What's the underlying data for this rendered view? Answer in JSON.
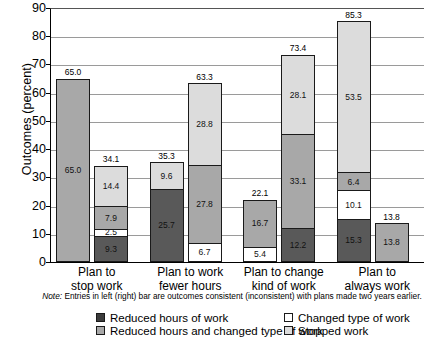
{
  "chart_data": {
    "type": "bar",
    "subtype": "stacked-grouped",
    "title": "",
    "xlabel": "",
    "ylabel": "Outcomes (percent)",
    "ylim": [
      0,
      90
    ],
    "ytick_step": 10,
    "yticks": [
      "90",
      "80",
      "70",
      "60",
      "50",
      "40",
      "30",
      "20",
      "10",
      "0"
    ],
    "grid": true,
    "legend_position": "bottom",
    "note": "Note: Entries in left (right) bar are outcomes consistent (inconsistent) with plans made two years earlier.",
    "note_italic_word": "Note:",
    "legend": [
      {
        "label": "Reduced hours of work",
        "key": "reduced_hours",
        "swatch": "dark"
      },
      {
        "label": "Changed type of work",
        "key": "changed_type",
        "swatch": "white"
      },
      {
        "label": "Reduced hours and changed type of work",
        "key": "reduced_and_changed",
        "swatch": "med"
      },
      {
        "label": "Stopped work",
        "key": "stopped_work",
        "swatch": "light"
      }
    ],
    "series": [
      {
        "name": "Reduced hours of work",
        "key": "reduced_hours",
        "color": "#595959"
      },
      {
        "name": "Changed type of work",
        "key": "changed_type",
        "color": "#ffffff"
      },
      {
        "name": "Reduced hours and changed type of work",
        "key": "reduced_and_changed",
        "color": "#a8a8a8"
      },
      {
        "name": "Stopped work",
        "key": "stopped_work",
        "color": "#dcdcdc"
      }
    ],
    "categories": [
      "Plan to stop work",
      "Plan to work fewer hours",
      "Plan to change kind of work",
      "Plan to always work"
    ],
    "groups": [
      {
        "category_line1": "Plan to",
        "category_line2": "stop work",
        "bars": [
          {
            "side": "left",
            "meaning": "consistent",
            "total": "65.0",
            "total_value": 65.0,
            "segments": [
              {
                "key": "stopped_work",
                "swatch": "med",
                "value": 65.0,
                "label": "65.0"
              }
            ]
          },
          {
            "side": "right",
            "meaning": "inconsistent",
            "total": "34.1",
            "total_value": 34.1,
            "segments": [
              {
                "key": "stopped_work",
                "swatch": "light",
                "value": 14.4,
                "label": "14.4"
              },
              {
                "key": "reduced_and_changed",
                "swatch": "med",
                "value": 7.9,
                "label": "7.9"
              },
              {
                "key": "changed_type",
                "swatch": "white",
                "value": 2.5,
                "label": "2.5"
              },
              {
                "key": "reduced_hours",
                "swatch": "dark",
                "value": 9.3,
                "label": "9.3"
              }
            ]
          }
        ]
      },
      {
        "category_line1": "Plan to work",
        "category_line2": "fewer hours",
        "bars": [
          {
            "side": "left",
            "meaning": "consistent",
            "total": "35.3",
            "total_value": 35.3,
            "segments": [
              {
                "key": "stopped_work",
                "swatch": "light",
                "value": 9.6,
                "label": "9.6"
              },
              {
                "key": "reduced_hours",
                "swatch": "dark",
                "value": 25.7,
                "label": "25.7"
              }
            ]
          },
          {
            "side": "right",
            "meaning": "inconsistent",
            "total": "63.3",
            "total_value": 63.3,
            "segments": [
              {
                "key": "stopped_work",
                "swatch": "light",
                "value": 28.8,
                "label": "28.8"
              },
              {
                "key": "reduced_and_changed",
                "swatch": "med",
                "value": 27.8,
                "label": "27.8"
              },
              {
                "key": "changed_type",
                "swatch": "white",
                "value": 6.7,
                "label": "6.7"
              }
            ]
          }
        ]
      },
      {
        "category_line1": "Plan to change",
        "category_line2": "kind of work",
        "bars": [
          {
            "side": "left",
            "meaning": "consistent",
            "total": "22.1",
            "total_value": 22.1,
            "segments": [
              {
                "key": "reduced_and_changed",
                "swatch": "med",
                "value": 16.7,
                "label": "16.7"
              },
              {
                "key": "changed_type",
                "swatch": "white",
                "value": 5.4,
                "label": "5.4"
              }
            ]
          },
          {
            "side": "right",
            "meaning": "inconsistent",
            "total": "73.4",
            "total_value": 73.4,
            "segments": [
              {
                "key": "stopped_work",
                "swatch": "light",
                "value": 28.1,
                "label": "28.1"
              },
              {
                "key": "reduced_and_changed",
                "swatch": "med",
                "value": 33.1,
                "label": "33.1"
              },
              {
                "key": "reduced_hours",
                "swatch": "dark",
                "value": 12.2,
                "label": "12.2"
              }
            ]
          }
        ]
      },
      {
        "category_line1": "Plan to",
        "category_line2": "always work",
        "bars": [
          {
            "side": "left",
            "meaning": "consistent",
            "total": "85.3",
            "total_value": 85.3,
            "segments": [
              {
                "key": "stopped_work",
                "swatch": "light",
                "value": 53.5,
                "label": "53.5"
              },
              {
                "key": "reduced_and_changed",
                "swatch": "med",
                "value": 6.4,
                "label": "6.4"
              },
              {
                "key": "changed_type",
                "swatch": "white",
                "value": 10.1,
                "label": "10.1"
              },
              {
                "key": "reduced_hours",
                "swatch": "dark",
                "value": 15.3,
                "label": "15.3"
              }
            ]
          },
          {
            "side": "right",
            "meaning": "inconsistent",
            "total": "13.8",
            "total_value": 13.8,
            "segments": [
              {
                "key": "reduced_and_changed",
                "swatch": "med",
                "value": 13.8,
                "label": "13.8"
              }
            ]
          }
        ]
      }
    ]
  }
}
